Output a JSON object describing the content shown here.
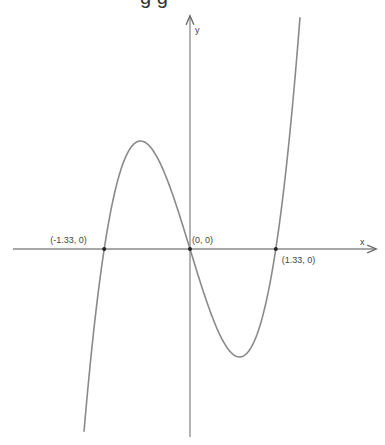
{
  "title_fragment": "g g",
  "chart_data": {
    "type": "line",
    "title": "",
    "xlabel": "x",
    "ylabel": "y",
    "function": "cubic with roots at x = -1.33, 0, 1.33 (y = 3x^3 - 4x shape)",
    "roots": [
      -1.33,
      0,
      1.33
    ],
    "annotations": [
      {
        "label": "(-1.33, 0)",
        "x": -1.33,
        "y": 0
      },
      {
        "label": "(0, 0)",
        "x": 0,
        "y": 0
      },
      {
        "label": "(1.33, 0)",
        "x": 1.33,
        "y": 0
      }
    ],
    "local_max": {
      "x": -0.77,
      "approx": true
    },
    "local_min": {
      "x": 0.77,
      "approx": true
    },
    "grid": false,
    "legend": "none",
    "colors": {
      "curve": "#8a8a8a",
      "axes": "#8a8a8a",
      "points": "#222222"
    }
  },
  "layout": {
    "origin_px": [
      190,
      249
    ],
    "x_scale_px": 64.5,
    "y_scale_px": 70,
    "x_axis_px": [
      13,
      375
    ],
    "y_axis_px": [
      437,
      17
    ],
    "curve_clip_y_px": [
      17,
      437
    ]
  }
}
